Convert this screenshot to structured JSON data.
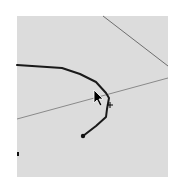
{
  "canvas": {
    "background": "#dcdcdc",
    "left": 17,
    "top": 16,
    "width": 151,
    "height": 161
  },
  "guides": [
    {
      "name": "diagonal-guide-upper",
      "from": [
        103,
        16
      ],
      "to": [
        168,
        66
      ],
      "color": "#6e6e6e"
    },
    {
      "name": "diagonal-guide-middle",
      "from": [
        17,
        119
      ],
      "to": [
        168,
        78
      ],
      "color": "#8a8a8a"
    }
  ],
  "stroke": {
    "color": "#1a1a1a",
    "width": 2,
    "points": [
      [
        17,
        65
      ],
      [
        62,
        68
      ],
      [
        80,
        74
      ],
      [
        96,
        82
      ],
      [
        106,
        93
      ],
      [
        109,
        98
      ],
      [
        107,
        109
      ],
      [
        106,
        117
      ],
      [
        96,
        126
      ],
      [
        83,
        136
      ]
    ],
    "end_dot": [
      83,
      136
    ]
  },
  "stray_dot": [
    18,
    154
  ],
  "cursor": {
    "type": "arrow-pointer",
    "x": 95,
    "y": 91
  },
  "crosshair": {
    "x": 110,
    "y": 105
  }
}
